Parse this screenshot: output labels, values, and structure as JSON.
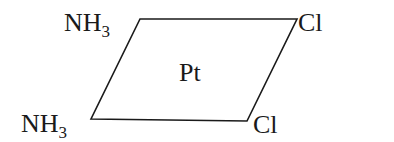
{
  "diagram": {
    "center": "Pt",
    "ligands": {
      "top_left": {
        "base": "NH",
        "sub": "3"
      },
      "bottom_left": {
        "base": "NH",
        "sub": "3"
      },
      "top_right": {
        "text": "Cl"
      },
      "bottom_right": {
        "text": "Cl"
      }
    },
    "line_color": "#1a1a1a",
    "vertices": [
      [
        140,
        19
      ],
      [
        297,
        19
      ],
      [
        247,
        121
      ],
      [
        91,
        119
      ]
    ]
  }
}
